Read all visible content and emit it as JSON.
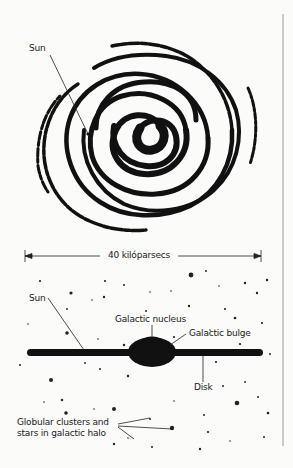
{
  "figure": {
    "type": "galaxy-structure-diagram",
    "face_on_view": {
      "labels": {
        "sun": "Sun"
      }
    },
    "scale_bar": {
      "label": "40 kilóparsecs"
    },
    "edge_on_view": {
      "labels": {
        "sun": "Sun",
        "galactic_nucleus": "Galactic nucleus",
        "galactic_bulge": "Galactic bulge",
        "disk": "Disk",
        "halo_line1": "Globular clusters and",
        "halo_line2": "stars in galactic halo"
      }
    },
    "colors": {
      "ink": "#111111",
      "paper": "#fbfbf9",
      "border": "#9a9a9a"
    }
  }
}
